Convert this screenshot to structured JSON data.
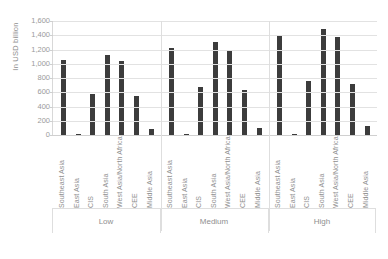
{
  "chart_data": {
    "type": "bar",
    "title": "",
    "subtitle": "",
    "xlabel": "",
    "ylabel": "In USD billion",
    "ylim": [
      0,
      1600
    ],
    "ytick_labels": [
      "1,600",
      "1,400",
      "1,200",
      "1,000",
      "800",
      "600",
      "400",
      "200",
      "0"
    ],
    "ytick_values": [
      1600,
      1400,
      1200,
      1000,
      800,
      600,
      400,
      200,
      0
    ],
    "grid": true,
    "legend": "none",
    "categories": [
      "Southeast Asia",
      "East Asia",
      "CIS",
      "South Asia",
      "West Asia/North Africa",
      "CEE",
      "Middle Asia"
    ],
    "groups": [
      "Low",
      "Medium",
      "High"
    ],
    "series": [
      {
        "name": "Low",
        "values": [
          1050,
          20,
          580,
          1120,
          1040,
          550,
          90
        ]
      },
      {
        "name": "Medium",
        "values": [
          1215,
          20,
          670,
          1300,
          1200,
          625,
          100
        ]
      },
      {
        "name": "High",
        "values": [
          1390,
          15,
          755,
          1490,
          1370,
          720,
          130
        ]
      }
    ],
    "bar_color": "#3c3c3c",
    "grid_color": "#e2e2e2",
    "text_color": "#8f8f8f"
  }
}
